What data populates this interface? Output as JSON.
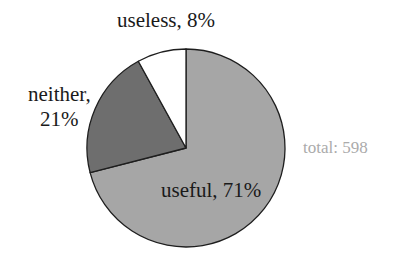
{
  "chart_data": {
    "type": "pie",
    "title": "",
    "categories": [
      "useful",
      "neither",
      "useless"
    ],
    "values": [
      71,
      21,
      8
    ],
    "unit": "%",
    "labels": [
      "useful, 71%",
      "neither, 21%",
      "useless, 8%"
    ],
    "colors": [
      "#a6a6a6",
      "#6e6e6e",
      "#ffffff"
    ],
    "start_angle": "12 o'clock, useful clockwise",
    "annotation": "total: 598",
    "total": 598,
    "legend": "none"
  },
  "labels": {
    "useless": "useless, 8%",
    "neither_line1": "neither,",
    "neither_line2": "21%",
    "useful": "useful, 71%",
    "total": "total: 598"
  }
}
